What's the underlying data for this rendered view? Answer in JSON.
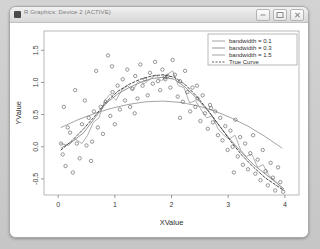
{
  "window": {
    "title": "R Graphics: Device 2 (ACTIVE)",
    "icon": "app-icon",
    "buttons": [
      {
        "name": "minimize",
        "icon": "minimize-icon"
      },
      {
        "name": "maximize",
        "icon": "maximize-icon"
      },
      {
        "name": "close",
        "icon": "close-icon"
      }
    ]
  },
  "chart_data": {
    "type": "scatter",
    "title": "",
    "xlabel": "XValue",
    "ylabel": "YValue",
    "xlim": [
      -0.25,
      4.25
    ],
    "ylim": [
      -0.75,
      1.8
    ],
    "xticks": [
      "0",
      "1",
      "2",
      "3",
      "4"
    ],
    "xtick_values": [
      0,
      1,
      2,
      3,
      4
    ],
    "yticks": [
      "1.5",
      "1.0",
      "0.5",
      "0.0",
      "-0.5"
    ],
    "ytick_values": [
      1.5,
      1.0,
      0.5,
      0.0,
      -0.5
    ],
    "grid": false,
    "legend_position": "top-right",
    "marker": "open-circle",
    "point_color": "#555555",
    "legend": [
      {
        "label": "bandwidth = 0.1",
        "style": "solid",
        "color": "#9a9a9a"
      },
      {
        "label": "bandwidth = 0.3",
        "style": "solid",
        "color": "#8a8a8a"
      },
      {
        "label": "bandwidth = 1.5",
        "style": "solid",
        "color": "#9a9a9a"
      },
      {
        "label": "True Curve",
        "style": "dashed",
        "color": "#4a4a4a"
      }
    ],
    "points": [
      [
        0.05,
        0.05
      ],
      [
        0.08,
        -0.12
      ],
      [
        0.1,
        0.62
      ],
      [
        0.13,
        -0.3
      ],
      [
        0.17,
        0.3
      ],
      [
        0.21,
        0.22
      ],
      [
        0.26,
        -0.4
      ],
      [
        0.3,
        0.88
      ],
      [
        0.33,
        0.05
      ],
      [
        0.38,
        -0.18
      ],
      [
        0.42,
        0.35
      ],
      [
        0.47,
        0.72
      ],
      [
        0.5,
        0.02
      ],
      [
        0.54,
        0.45
      ],
      [
        0.58,
        -0.22
      ],
      [
        0.63,
        0.55
      ],
      [
        0.67,
        1.18
      ],
      [
        0.7,
        0.3
      ],
      [
        0.75,
        0.62
      ],
      [
        0.79,
        0.2
      ],
      [
        0.84,
        0.7
      ],
      [
        0.88,
        1.42
      ],
      [
        0.92,
        0.48
      ],
      [
        0.96,
        0.85
      ],
      [
        1.0,
        0.35
      ],
      [
        1.05,
        0.95
      ],
      [
        1.09,
        0.58
      ],
      [
        1.14,
        1.05
      ],
      [
        1.18,
        0.72
      ],
      [
        1.22,
        1.2
      ],
      [
        1.27,
        0.62
      ],
      [
        1.31,
        0.9
      ],
      [
        1.36,
        1.1
      ],
      [
        1.4,
        0.75
      ],
      [
        1.45,
        1.28
      ],
      [
        1.49,
        0.95
      ],
      [
        1.53,
        1.05
      ],
      [
        1.58,
        0.8
      ],
      [
        1.62,
        1.15
      ],
      [
        1.67,
        0.98
      ],
      [
        1.71,
        1.32
      ],
      [
        1.76,
        1.02
      ],
      [
        1.8,
        0.88
      ],
      [
        1.84,
        1.2
      ],
      [
        1.89,
        1.05
      ],
      [
        1.93,
        1.1
      ],
      [
        1.98,
        0.92
      ],
      [
        2.02,
        1.35
      ],
      [
        2.06,
        1.12
      ],
      [
        2.11,
        0.78
      ],
      [
        2.15,
        1.02
      ],
      [
        2.2,
        0.7
      ],
      [
        2.24,
        1.18
      ],
      [
        2.28,
        0.85
      ],
      [
        2.33,
        0.55
      ],
      [
        2.37,
        0.92
      ],
      [
        2.42,
        0.62
      ],
      [
        2.46,
        0.75
      ],
      [
        2.51,
        0.4
      ],
      [
        2.55,
        0.8
      ],
      [
        2.59,
        0.52
      ],
      [
        2.64,
        0.28
      ],
      [
        2.68,
        0.65
      ],
      [
        2.73,
        0.38
      ],
      [
        2.77,
        0.55
      ],
      [
        2.82,
        0.18
      ],
      [
        2.86,
        0.45
      ],
      [
        2.9,
        0.1
      ],
      [
        2.95,
        0.32
      ],
      [
        2.99,
        -0.05
      ],
      [
        3.04,
        0.25
      ],
      [
        3.08,
        0.0
      ],
      [
        3.13,
        0.42
      ],
      [
        3.17,
        -0.15
      ],
      [
        3.21,
        0.15
      ],
      [
        3.26,
        -0.28
      ],
      [
        3.3,
        0.05
      ],
      [
        3.35,
        -0.35
      ],
      [
        3.39,
        -0.1
      ],
      [
        3.44,
        0.18
      ],
      [
        3.48,
        -0.42
      ],
      [
        3.52,
        -0.2
      ],
      [
        3.57,
        -0.52
      ],
      [
        3.61,
        -0.05
      ],
      [
        3.66,
        -0.38
      ],
      [
        3.7,
        -0.6
      ],
      [
        3.75,
        -0.25
      ],
      [
        3.79,
        -0.48
      ],
      [
        3.83,
        -0.68
      ],
      [
        3.88,
        -0.32
      ],
      [
        3.92,
        -0.55
      ],
      [
        3.97,
        -0.7
      ],
      [
        1.88,
        1.08
      ],
      [
        2.7,
        0.6
      ],
      [
        0.6,
        0.08
      ],
      [
        1.35,
        0.52
      ],
      [
        2.45,
        0.95
      ],
      [
        3.1,
        -0.4
      ],
      [
        0.95,
        1.25
      ],
      [
        2.15,
        0.45
      ]
    ],
    "curves": [
      {
        "name": "bandwidth = 0.1",
        "style": "solid",
        "color": "#9a9a9a",
        "width": 0.8,
        "points": [
          [
            0.05,
            0.05
          ],
          [
            0.18,
            0.02
          ],
          [
            0.3,
            0.12
          ],
          [
            0.42,
            0.05
          ],
          [
            0.52,
            0.18
          ],
          [
            0.62,
            0.38
          ],
          [
            0.72,
            0.45
          ],
          [
            0.82,
            0.72
          ],
          [
            0.92,
            0.82
          ],
          [
            1.02,
            0.72
          ],
          [
            1.12,
            0.88
          ],
          [
            1.22,
            0.95
          ],
          [
            1.32,
            0.88
          ],
          [
            1.42,
            1.02
          ],
          [
            1.52,
            0.98
          ],
          [
            1.62,
            1.05
          ],
          [
            1.72,
            1.12
          ],
          [
            1.82,
            1.02
          ],
          [
            1.92,
            1.12
          ],
          [
            2.02,
            1.18
          ],
          [
            2.12,
            0.95
          ],
          [
            2.22,
            0.92
          ],
          [
            2.32,
            0.68
          ],
          [
            2.42,
            0.72
          ],
          [
            2.52,
            0.58
          ],
          [
            2.62,
            0.45
          ],
          [
            2.72,
            0.48
          ],
          [
            2.82,
            0.28
          ],
          [
            2.92,
            0.18
          ],
          [
            3.02,
            0.12
          ],
          [
            3.12,
            0.18
          ],
          [
            3.22,
            -0.05
          ],
          [
            3.32,
            -0.15
          ],
          [
            3.42,
            -0.12
          ],
          [
            3.52,
            -0.32
          ],
          [
            3.62,
            -0.28
          ],
          [
            3.72,
            -0.45
          ],
          [
            3.82,
            -0.52
          ],
          [
            3.92,
            -0.62
          ],
          [
            3.98,
            -0.68
          ]
        ]
      },
      {
        "name": "bandwidth = 0.3",
        "style": "solid",
        "color": "#8a8a8a",
        "width": 0.9,
        "points": [
          [
            0.05,
            -0.02
          ],
          [
            0.25,
            0.08
          ],
          [
            0.45,
            0.22
          ],
          [
            0.65,
            0.45
          ],
          [
            0.85,
            0.68
          ],
          [
            1.05,
            0.82
          ],
          [
            1.25,
            0.92
          ],
          [
            1.45,
            1.0
          ],
          [
            1.65,
            1.06
          ],
          [
            1.85,
            1.08
          ],
          [
            2.05,
            1.05
          ],
          [
            2.25,
            0.92
          ],
          [
            2.45,
            0.75
          ],
          [
            2.65,
            0.55
          ],
          [
            2.85,
            0.32
          ],
          [
            3.05,
            0.1
          ],
          [
            3.25,
            -0.1
          ],
          [
            3.45,
            -0.28
          ],
          [
            3.65,
            -0.42
          ],
          [
            3.85,
            -0.56
          ],
          [
            3.98,
            -0.65
          ]
        ]
      },
      {
        "name": "bandwidth = 1.5",
        "style": "solid",
        "color": "#9a9a9a",
        "width": 0.9,
        "points": [
          [
            0.05,
            0.3
          ],
          [
            0.35,
            0.42
          ],
          [
            0.65,
            0.52
          ],
          [
            0.95,
            0.6
          ],
          [
            1.25,
            0.66
          ],
          [
            1.55,
            0.7
          ],
          [
            1.85,
            0.71
          ],
          [
            2.15,
            0.69
          ],
          [
            2.45,
            0.64
          ],
          [
            2.75,
            0.56
          ],
          [
            3.05,
            0.45
          ],
          [
            3.35,
            0.32
          ],
          [
            3.65,
            0.16
          ],
          [
            3.95,
            -0.02
          ]
        ]
      },
      {
        "name": "True Curve",
        "style": "dashed",
        "color": "#4a4a4a",
        "width": 1.0,
        "points": [
          [
            0.05,
            -0.05
          ],
          [
            0.25,
            0.1
          ],
          [
            0.45,
            0.28
          ],
          [
            0.65,
            0.48
          ],
          [
            0.85,
            0.7
          ],
          [
            1.05,
            0.86
          ],
          [
            1.25,
            0.97
          ],
          [
            1.45,
            1.05
          ],
          [
            1.65,
            1.1
          ],
          [
            1.85,
            1.12
          ],
          [
            2.05,
            1.08
          ],
          [
            2.25,
            0.96
          ],
          [
            2.45,
            0.78
          ],
          [
            2.65,
            0.56
          ],
          [
            2.85,
            0.32
          ],
          [
            3.05,
            0.08
          ],
          [
            3.25,
            -0.14
          ],
          [
            3.45,
            -0.32
          ],
          [
            3.65,
            -0.48
          ],
          [
            3.85,
            -0.6
          ],
          [
            3.98,
            -0.68
          ]
        ]
      }
    ]
  }
}
